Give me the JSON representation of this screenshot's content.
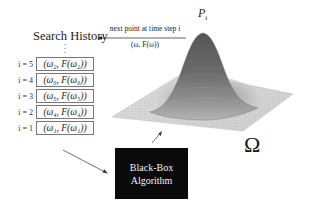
{
  "search_history": {
    "title": "Search History",
    "ellipsis": "⋮",
    "rows": [
      {
        "label": "i = 5",
        "value": "(ω₂, F(ω₂))"
      },
      {
        "label": "i = 4",
        "value": "(ω₀, F(ω₀))"
      },
      {
        "label": "i = 3",
        "value": "(ω₅, F(ω₅))"
      },
      {
        "label": "i = 2",
        "value": "(ω₄, F(ω₄))"
      },
      {
        "label": "i = 1",
        "value": "(ω₁, F(ω₁))"
      }
    ]
  },
  "top_arrow": {
    "label": "next point at time step i",
    "sublabel": "(ω, F(ω))",
    "icon": "arrow-left-icon"
  },
  "surface": {
    "peak_label": "P",
    "peak_subscript": "i",
    "domain_label": "Ω",
    "description": "3D Gaussian surface over domain grid",
    "colors": {
      "peak": "#5a5a5a",
      "mid": "#8c8c8c",
      "plane": "#d6d6d6",
      "grid": "#b8b8b8"
    }
  },
  "black_box": {
    "line1": "Black-Box",
    "line2": "Algorithm",
    "bg_color": "#0a0a0a",
    "text_color": "#f2f2f2"
  },
  "arrows": {
    "history_to_algorithm": "arrow-down-right-icon",
    "algorithm_to_surface": "arrow-up-right-icon"
  }
}
